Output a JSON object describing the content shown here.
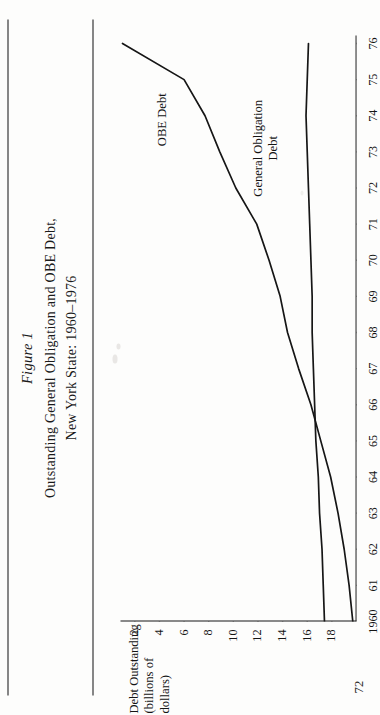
{
  "page": {
    "folio": "72",
    "figure_number": "Figure 1",
    "title_line_1": "Outstanding General Obligation and OBE Debt,",
    "title_line_2": "New York State: 1960–1976"
  },
  "axis": {
    "y_label_line_1": "Debt Outstanding",
    "y_label_line_2": "(billions of dollars)",
    "y_ticks": [
      "18",
      "16",
      "14",
      "12",
      "10",
      "8",
      "6",
      "4",
      "2"
    ],
    "x_ticks": [
      "1960",
      "61",
      "62",
      "63",
      "64",
      "65",
      "66",
      "67",
      "68",
      "69",
      "70",
      "71",
      "72",
      "73",
      "74",
      "75",
      "76"
    ]
  },
  "series_labels": {
    "obe": "OBE Debt",
    "go_line_1": "General Obligation",
    "go_line_2": "Debt"
  },
  "colors": {
    "ink": "#1a1a1a",
    "paper": "#fdfdfc",
    "line": "#161616"
  },
  "chart_data": {
    "type": "line",
    "title": "Outstanding General Obligation and OBE Debt, New York State: 1960–1976",
    "xlabel": "",
    "ylabel": "Debt Outstanding (billions of dollars)",
    "xlim": [
      1960,
      1976
    ],
    "ylim": [
      0,
      19
    ],
    "ytick_values": [
      2,
      4,
      6,
      8,
      10,
      12,
      14,
      16,
      18
    ],
    "grid": false,
    "legend": "inline-annotations",
    "x": [
      1960,
      1961,
      1962,
      1963,
      1964,
      1965,
      1966,
      1967,
      1968,
      1969,
      1970,
      1971,
      1972,
      1973,
      1974,
      1975,
      1976
    ],
    "series": [
      {
        "name": "OBE Debt",
        "values": [
          0.3,
          0.6,
          1.0,
          1.5,
          2.1,
          2.9,
          3.7,
          4.7,
          5.6,
          6.2,
          7.1,
          8.1,
          9.8,
          11.1,
          12.3,
          14.0,
          19.0
        ]
      },
      {
        "name": "General Obligation Debt",
        "values": [
          2.6,
          2.7,
          2.8,
          3.0,
          3.1,
          3.3,
          3.4,
          3.5,
          3.6,
          3.6,
          3.7,
          3.8,
          3.9,
          4.0,
          4.1,
          4.0,
          3.9
        ]
      }
    ]
  }
}
